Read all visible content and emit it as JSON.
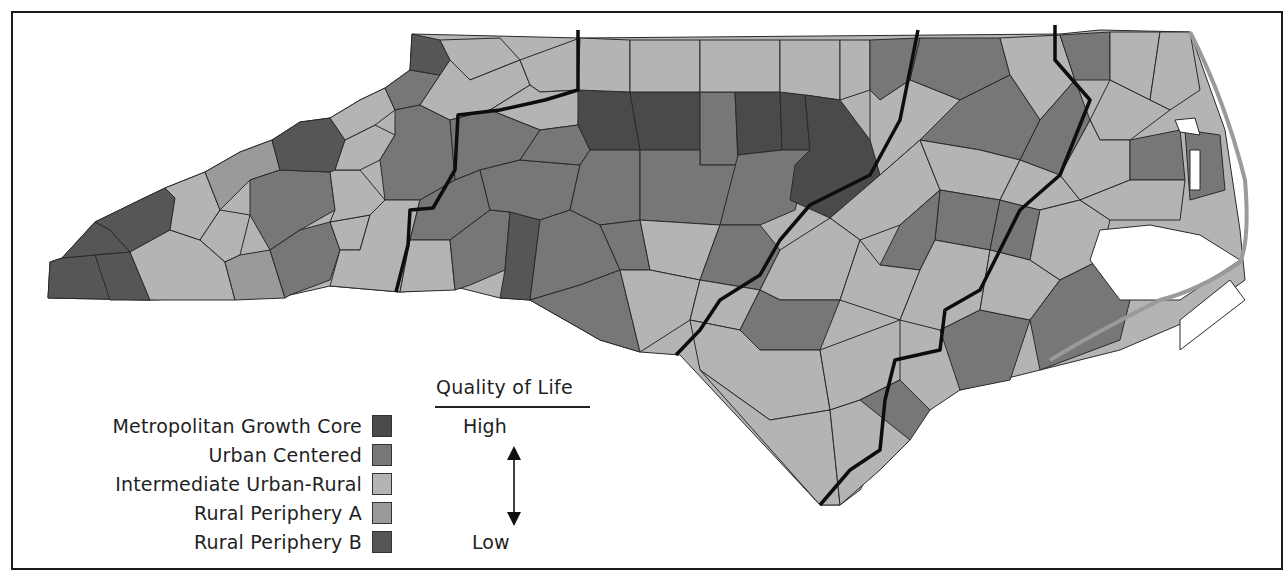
{
  "map": {
    "title": "Quality of Life",
    "subject": "North Carolina counties by urban-rural classification",
    "region_dividers_count": 4,
    "categories": [
      {
        "key": "metro",
        "label": "Metropolitan Growth Core",
        "color": "#4a4a4a"
      },
      {
        "key": "urban",
        "label": "Urban Centered",
        "color": "#777777"
      },
      {
        "key": "inter",
        "label": "Intermediate Urban-Rural",
        "color": "#b4b4b4"
      },
      {
        "key": "ruralA",
        "label": "Rural Periphery A",
        "color": "#9a9a9a"
      },
      {
        "key": "ruralB",
        "label": "Rural Periphery B",
        "color": "#565656"
      }
    ]
  },
  "legend": {
    "scale_title": "Quality of Life",
    "high_label": "High",
    "low_label": "Low",
    "items": [
      {
        "label": "Metropolitan Growth Core",
        "color": "#4a4a4a"
      },
      {
        "label": "Urban Centered",
        "color": "#777777"
      },
      {
        "label": "Intermediate Urban-Rural",
        "color": "#b4b4b4"
      },
      {
        "label": "Rural Periphery A",
        "color": "#9a9a9a"
      },
      {
        "label": "Rural Periphery B",
        "color": "#565656"
      }
    ]
  },
  "colors": {
    "county_border": "#2a2a2a",
    "region_border": "#0d0d0d",
    "frame": "#1a1a1a",
    "water": "#ffffff"
  }
}
